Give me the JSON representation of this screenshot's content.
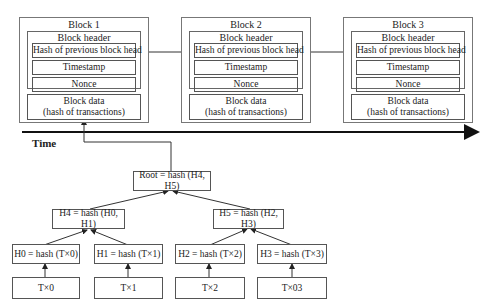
{
  "blocks": [
    {
      "title": "Block 1",
      "header_title": "Block header",
      "fields": [
        "Hash of previous block head",
        "Timestamp",
        "Nonce"
      ],
      "data_line1": "Block data",
      "data_line2": "(hash of transactions)"
    },
    {
      "title": "Block 2",
      "header_title": "Block header",
      "fields": [
        "Hash of previous block head",
        "Timestamp",
        "Nonce"
      ],
      "data_line1": "Block data",
      "data_line2": "(hash of transactions)"
    },
    {
      "title": "Block 3",
      "header_title": "Block header",
      "fields": [
        "Hash of previous block head",
        "Timestamp",
        "Nonce"
      ],
      "data_line1": "Block data",
      "data_line2": "(hash of transactions)"
    }
  ],
  "timeline": {
    "label": "Time"
  },
  "merkle_tree": {
    "root": "Root = hash (H4, H5)",
    "level1": [
      "H4 = hash (H0, H1)",
      "H5 = hash (H2, H3)"
    ],
    "level2": [
      "H0 = hash (T×0)",
      "H1 = hash (T×1)",
      "H2 = hash (T×2)",
      "H3 = hash (T×3)"
    ],
    "leaves": [
      "T×0",
      "T×1",
      "T×2",
      "T×03"
    ]
  }
}
